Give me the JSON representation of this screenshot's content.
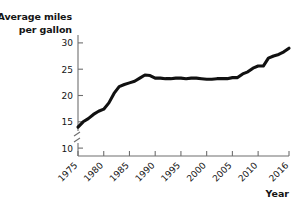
{
  "chart_data": {
    "type": "line",
    "title": "",
    "subtitle": "",
    "xlabel": "Year",
    "ylabel": "Average miles per gallon",
    "ylabel_line1": "Average miles",
    "ylabel_line2": "per gallon",
    "xlim": [
      1975,
      2016
    ],
    "ylim": [
      8.5,
      31.5
    ],
    "y_axis_break": true,
    "y_axis_break_note": "zigzag break on y-axis below the 10 tick",
    "grid": false,
    "legend": null,
    "yticks": [
      10,
      15,
      20,
      25,
      30
    ],
    "ytick_labels": [
      "10",
      "15",
      "20",
      "25",
      "30"
    ],
    "xticks": [
      1975,
      1980,
      1985,
      1990,
      1995,
      2000,
      2005,
      2010,
      2016
    ],
    "xtick_labels": [
      "1975",
      "1980",
      "1985",
      "1990",
      "1995",
      "2000",
      "2005",
      "2010",
      "2016"
    ],
    "xtick_rotation_deg": 45,
    "line_color": "#111111",
    "axis_color": "#6f6f6f",
    "background_color": "#ffffff",
    "series": [
      {
        "name": "Average miles per gallon",
        "x": [
          1975,
          1976,
          1977,
          1978,
          1979,
          1980,
          1981,
          1982,
          1983,
          1984,
          1985,
          1986,
          1987,
          1988,
          1989,
          1990,
          1991,
          1992,
          1993,
          1994,
          1995,
          1996,
          1997,
          1998,
          1999,
          2000,
          2001,
          2002,
          2003,
          2004,
          2005,
          2006,
          2007,
          2008,
          2009,
          2010,
          2011,
          2012,
          2013,
          2014,
          2015,
          2016
        ],
        "values": [
          14.0,
          15.0,
          15.6,
          16.4,
          17.0,
          17.4,
          18.6,
          20.4,
          21.7,
          22.1,
          22.4,
          22.7,
          23.3,
          23.9,
          23.8,
          23.3,
          23.3,
          23.2,
          23.2,
          23.3,
          23.3,
          23.2,
          23.3,
          23.3,
          23.2,
          23.1,
          23.1,
          23.2,
          23.2,
          23.2,
          23.4,
          23.4,
          24.1,
          24.5,
          25.2,
          25.6,
          25.6,
          27.1,
          27.5,
          27.8,
          28.3,
          29.0
        ]
      }
    ]
  }
}
